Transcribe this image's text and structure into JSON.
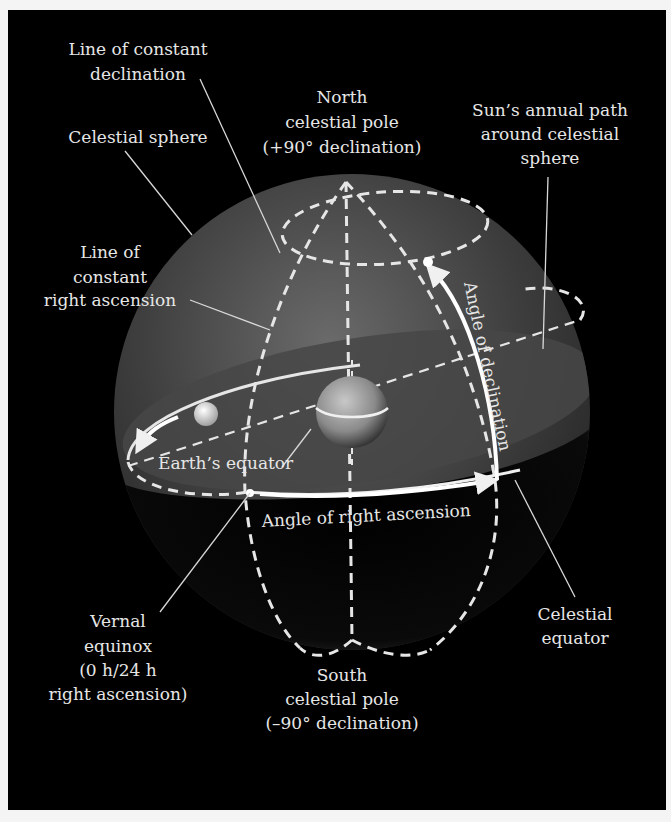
{
  "figure": {
    "background": "#000000",
    "sphere_color": "#5a5a5a",
    "line_color": "#e6e6e6",
    "labels": {
      "line_constant_declination": [
        "Line of constant",
        "declination"
      ],
      "north_pole": [
        "North",
        "celestial pole",
        "(+90° declination)"
      ],
      "suns_path": [
        "Sun’s annual path",
        "around celestial",
        "sphere"
      ],
      "celestial_sphere": [
        "Celestial sphere"
      ],
      "line_constant_ra": [
        "Line of",
        "constant",
        "right ascension"
      ],
      "earths_equator": [
        "Earth’s equator"
      ],
      "angle_declination": [
        "Angle of declination"
      ],
      "angle_ra": [
        "Angle of right ascension"
      ],
      "vernal_equinox": [
        "Vernal",
        "equinox",
        "(0 h/24 h",
        "right ascension)"
      ],
      "celestial_equator": [
        "Celestial",
        "equator"
      ],
      "south_pole": [
        "South",
        "celestial pole",
        "(–90° declination)"
      ]
    }
  }
}
